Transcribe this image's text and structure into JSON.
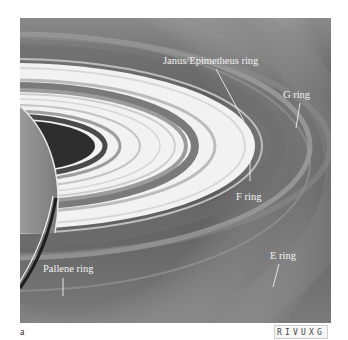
{
  "figure": {
    "labels": {
      "janus": "Janus/Epimetheus ring",
      "g_ring": "G ring",
      "f_ring": "F ring",
      "e_ring": "E ring",
      "pallene": "Pallene ring"
    },
    "colors": {
      "background": "#6b6b6b",
      "ring_bright": "#f2f2f2",
      "label_text": "#f4f4f4"
    }
  },
  "caption": {
    "panel_letter": "a",
    "wavelength_band": "RIVUXG"
  }
}
